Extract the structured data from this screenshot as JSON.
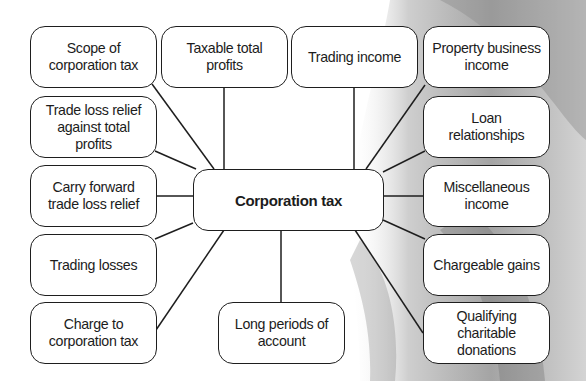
{
  "diagram": {
    "title": "Corporation tax",
    "center": {
      "label": "Corporation tax"
    },
    "nodes": [
      {
        "id": "scope",
        "label": "Scope of\ncorporation tax"
      },
      {
        "id": "taxable",
        "label": "Taxable total\nprofits"
      },
      {
        "id": "trading_income",
        "label": "Trading income"
      },
      {
        "id": "property",
        "label": "Property business\nincome"
      },
      {
        "id": "trade_loss_relief",
        "label": "Trade loss relief\nagainst total\nprofits"
      },
      {
        "id": "loan",
        "label": "Loan\nrelationships"
      },
      {
        "id": "carry_forward",
        "label": "Carry forward\ntrade loss relief"
      },
      {
        "id": "misc",
        "label": "Miscellaneous\nincome"
      },
      {
        "id": "trading_losses",
        "label": "Trading losses"
      },
      {
        "id": "chargeable",
        "label": "Chargeable gains"
      },
      {
        "id": "charge",
        "label": "Charge to\ncorporation tax"
      },
      {
        "id": "long_periods",
        "label": "Long periods of\naccount"
      },
      {
        "id": "qualifying",
        "label": "Qualifying\ncharitable\ndonations"
      }
    ],
    "colors": {
      "border": "#1e1e1e",
      "box_fill": "#ffffff",
      "text": "#1c1c1c",
      "background": "#ffffff"
    }
  }
}
